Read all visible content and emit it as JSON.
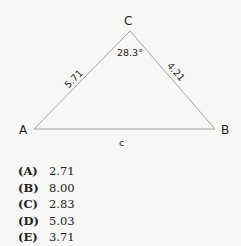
{
  "diagram": {
    "vertices": {
      "A": "A",
      "B": "B",
      "C": "C"
    },
    "side_labels": {
      "AC": "5.71",
      "BC": "4.21",
      "AB": "c"
    },
    "angle_label": "28.3°"
  },
  "choices": [
    {
      "letter": "(A)",
      "value": "2.71"
    },
    {
      "letter": "(B)",
      "value": "8.00"
    },
    {
      "letter": "(C)",
      "value": "2.83"
    },
    {
      "letter": "(D)",
      "value": "5.03"
    },
    {
      "letter": "(E)",
      "value": "3.71"
    }
  ]
}
